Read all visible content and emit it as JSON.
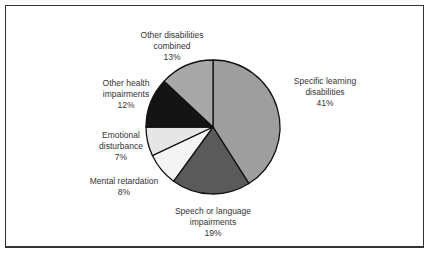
{
  "chart_data": {
    "type": "pie",
    "title": "",
    "categories": [
      "Specific learning disabilities",
      "Speech or language impairments",
      "Mental retardation",
      "Emotional disturbance",
      "Other health impairments",
      "Other disabilities combined"
    ],
    "values": [
      41,
      19,
      8,
      7,
      12,
      13
    ],
    "colors": [
      "#9e9e9e",
      "#5a5a5a",
      "#f4f4f4",
      "#e6e6e6",
      "#141414",
      "#a8a8a8"
    ],
    "start_angle_deg": 0,
    "direction": "clockwise"
  },
  "labels": [
    {
      "lines": [
        "Specific learning",
        "disabilities"
      ],
      "pct": "41%"
    },
    {
      "lines": [
        "Speech or language",
        "impairments"
      ],
      "pct": "19%"
    },
    {
      "lines": [
        "Mental retardation"
      ],
      "pct": "8%"
    },
    {
      "lines": [
        "Emotional",
        "disturbance"
      ],
      "pct": "7%"
    },
    {
      "lines": [
        "Other health",
        "impairments"
      ],
      "pct": "12%"
    },
    {
      "lines": [
        "Other disabilities",
        "combined"
      ],
      "pct": "13%"
    }
  ]
}
